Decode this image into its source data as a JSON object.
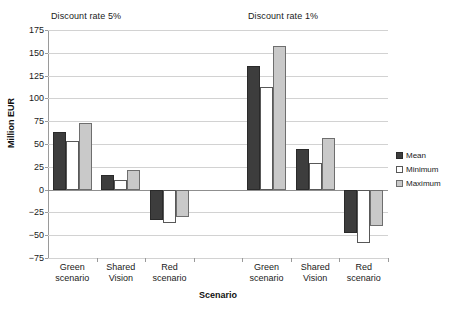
{
  "chart_data": {
    "type": "bar",
    "title": "",
    "xlabel": "Scenario",
    "ylabel": "Million EUR",
    "ylim": [
      -75,
      175
    ],
    "yticks": [
      175,
      150,
      125,
      100,
      75,
      50,
      25,
      0,
      -25,
      -50,
      -75
    ],
    "grid": true,
    "legend_position": "right",
    "panel_titles": [
      "Discount rate 5%",
      "Discount rate 1%"
    ],
    "categories": [
      "Green scenario",
      "Shared Vision",
      "Red scenario",
      "",
      "Green scenario",
      "Shared Vision",
      "Red scenario"
    ],
    "category_lines": [
      [
        "Green",
        "scenario"
      ],
      [
        "Shared",
        "Vision"
      ],
      [
        "Red",
        "scenario"
      ],
      [
        "",
        ""
      ],
      [
        "Green",
        "scenario"
      ],
      [
        "Shared",
        "Vision"
      ],
      [
        "Red",
        "scenario"
      ]
    ],
    "series": [
      {
        "name": "Mean",
        "color": "#3d3d3d",
        "values": [
          63,
          16,
          -33,
          null,
          135,
          45,
          -48
        ]
      },
      {
        "name": "Minimum",
        "color": "#ffffff",
        "values": [
          53,
          10,
          -37,
          null,
          113,
          29,
          -59
        ]
      },
      {
        "name": "Maximum",
        "color": "#c9c9c9",
        "values": [
          73,
          21,
          -30,
          null,
          158,
          57,
          -40
        ]
      }
    ]
  },
  "legend": {
    "items": [
      {
        "label": "Mean",
        "key": "mean"
      },
      {
        "label": "Minimum",
        "key": "minimum"
      },
      {
        "label": "Maximum",
        "key": "maximum"
      }
    ]
  },
  "axis": {
    "y_title": "Million EUR",
    "x_title": "Scenario"
  },
  "panels": {
    "left_title": "Discount rate 5%",
    "right_title": "Discount rate 1%"
  }
}
